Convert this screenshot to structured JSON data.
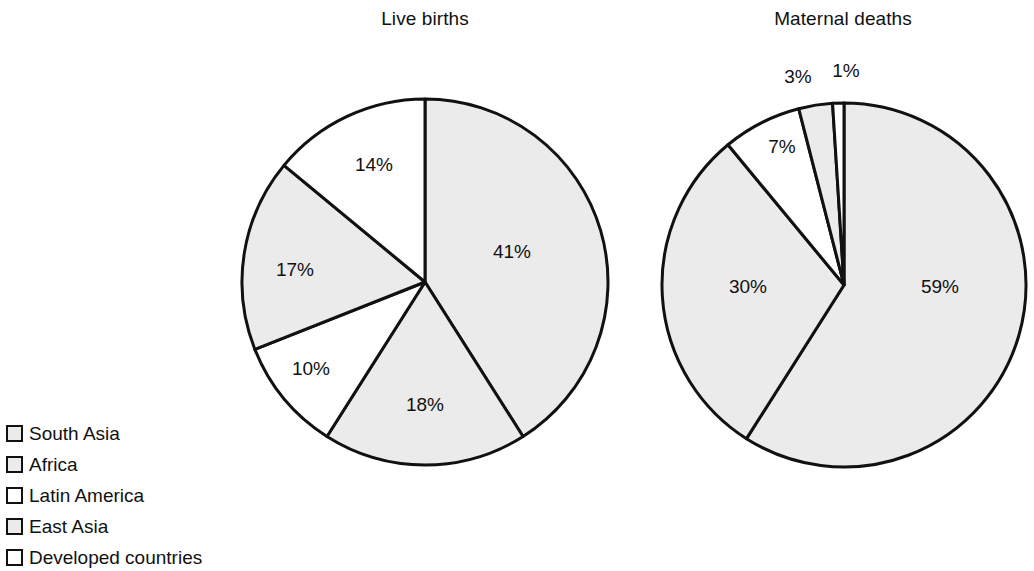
{
  "legend": {
    "items": [
      {
        "label": "South Asia",
        "color": "#ebebeb"
      },
      {
        "label": "Africa",
        "color": "#ebebeb"
      },
      {
        "label": "Latin America",
        "color": "#ffffff"
      },
      {
        "label": "East Asia",
        "color": "#ebebeb"
      },
      {
        "label": "Developed countries",
        "color": "#ffffff"
      }
    ]
  },
  "chart_data": [
    {
      "type": "pie",
      "title": "Live births",
      "categories": [
        "South Asia",
        "Africa",
        "Latin America",
        "East Asia",
        "Developed countries"
      ],
      "values": [
        41,
        18,
        10,
        17,
        14
      ],
      "labels": [
        "41%",
        "18%",
        "10%",
        "17%",
        "14%"
      ],
      "colors": [
        "#ebebeb",
        "#ebebeb",
        "#ffffff",
        "#ebebeb",
        "#ffffff"
      ],
      "start_angle_deg": 0,
      "direction": "clockwise",
      "legend_position": "bottom-left",
      "grid": false
    },
    {
      "type": "pie",
      "title": "Maternal deaths",
      "categories": [
        "South Asia",
        "Africa",
        "Latin America",
        "East Asia",
        "Developed countries"
      ],
      "values": [
        59,
        30,
        7,
        3,
        1
      ],
      "labels": [
        "59%",
        "30%",
        "7%",
        "3%",
        "1%"
      ],
      "colors": [
        "#ebebeb",
        "#ebebeb",
        "#ffffff",
        "#ebebeb",
        "#ffffff"
      ],
      "start_angle_deg": 0,
      "direction": "clockwise",
      "legend_position": "bottom-left",
      "grid": false
    }
  ]
}
